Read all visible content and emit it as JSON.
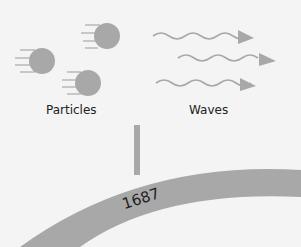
{
  "diagram": {
    "particles_label": "Particles",
    "waves_label": "Waves",
    "year": "1687",
    "colors": {
      "background": "#f4f4f4",
      "shape_gray": "#a8a8a8",
      "text": "#222222"
    }
  }
}
